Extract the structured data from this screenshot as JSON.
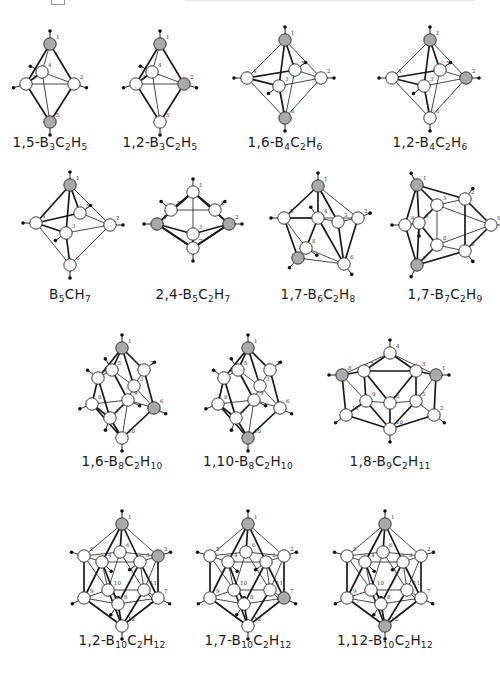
{
  "figure": {
    "colors": {
      "carbon_atom": "#a9a9a9",
      "boron_atom": "#ffffff",
      "bond": "#1a1a1a",
      "hydrogen": "#111111"
    },
    "legend": {
      "gray_circle": "carbon",
      "white_circle": "boron",
      "small_dot": "hydrogen"
    }
  },
  "molecules": [
    {
      "id": "m1",
      "prefix": "1,5-",
      "formula": [
        [
          "B",
          "3"
        ],
        [
          "C",
          "2"
        ],
        [
          "H",
          "5"
        ]
      ],
      "label": "1,5-B3C2H5",
      "carbons": [
        "1",
        "5"
      ],
      "row": 1
    },
    {
      "id": "m2",
      "prefix": "1,2-",
      "formula": [
        [
          "B",
          "3"
        ],
        [
          "C",
          "2"
        ],
        [
          "H",
          "5"
        ]
      ],
      "label": "1,2-B3C2H5",
      "carbons": [
        "1",
        "2"
      ],
      "row": 1
    },
    {
      "id": "m3",
      "prefix": "1,6-",
      "formula": [
        [
          "B",
          "4"
        ],
        [
          "C",
          "2"
        ],
        [
          "H",
          "6"
        ]
      ],
      "label": "1,6-B4C2H6",
      "carbons": [
        "1",
        "6"
      ],
      "row": 1
    },
    {
      "id": "m4",
      "prefix": "1,2-",
      "formula": [
        [
          "B",
          "4"
        ],
        [
          "C",
          "2"
        ],
        [
          "H",
          "6"
        ]
      ],
      "label": "1,2-B4C2H6",
      "carbons": [
        "1",
        "2"
      ],
      "row": 1
    },
    {
      "id": "m5",
      "prefix": "",
      "formula": [
        [
          "B",
          "5"
        ],
        [
          "C",
          ""
        ],
        [
          "H",
          "7"
        ]
      ],
      "label": "B5CH7",
      "carbons": [
        "1"
      ],
      "row": 2
    },
    {
      "id": "m6",
      "prefix": "2,4-",
      "formula": [
        [
          "B",
          "5"
        ],
        [
          "C",
          "2"
        ],
        [
          "H",
          "7"
        ]
      ],
      "label": "2,4-B5C2H7",
      "carbons": [
        "2",
        "4"
      ],
      "row": 2
    },
    {
      "id": "m7",
      "prefix": "1,7-",
      "formula": [
        [
          "B",
          "6"
        ],
        [
          "C",
          "2"
        ],
        [
          "H",
          "8"
        ]
      ],
      "label": "1,7-B6C2H8",
      "carbons": [
        "1",
        "7"
      ],
      "row": 2
    },
    {
      "id": "m8",
      "prefix": "1,7-",
      "formula": [
        [
          "B",
          "7"
        ],
        [
          "C",
          "2"
        ],
        [
          "H",
          "9"
        ]
      ],
      "label": "1,7-B7C2H9",
      "carbons": [
        "1",
        "7"
      ],
      "row": 2
    },
    {
      "id": "m9",
      "prefix": "1,6-",
      "formula": [
        [
          "B",
          "8"
        ],
        [
          "C",
          "2"
        ],
        [
          "H",
          "10"
        ]
      ],
      "label": "1,6-B8C2H10",
      "carbons": [
        "1",
        "6"
      ],
      "row": 3
    },
    {
      "id": "m10",
      "prefix": "1,10-",
      "formula": [
        [
          "B",
          "8"
        ],
        [
          "C",
          "2"
        ],
        [
          "H",
          "10"
        ]
      ],
      "label": "1,10-B8C2H10",
      "carbons": [
        "1",
        "10"
      ],
      "row": 3
    },
    {
      "id": "m11",
      "prefix": "1,8-",
      "formula": [
        [
          "B",
          "9"
        ],
        [
          "C",
          "2"
        ],
        [
          "H",
          "11"
        ]
      ],
      "label": "1,8-B9C2H11",
      "carbons": [
        "1",
        "8"
      ],
      "row": 3
    },
    {
      "id": "m12",
      "prefix": "1,2-",
      "formula": [
        [
          "B",
          "10"
        ],
        [
          "C",
          "2"
        ],
        [
          "H",
          "12"
        ]
      ],
      "label": "1,2-B10C2H12",
      "carbons": [
        "1",
        "2"
      ],
      "row": 4
    },
    {
      "id": "m13",
      "prefix": "1,7-",
      "formula": [
        [
          "B",
          "10"
        ],
        [
          "C",
          "2"
        ],
        [
          "H",
          "12"
        ]
      ],
      "label": "1,7-B10C2H12",
      "carbons": [
        "1",
        "7"
      ],
      "row": 4
    },
    {
      "id": "m14",
      "prefix": "1,12-",
      "formula": [
        [
          "B",
          "10"
        ],
        [
          "C",
          "2"
        ],
        [
          "H",
          "12"
        ]
      ],
      "label": "1,12-B10C2H12",
      "carbons": [
        "1",
        "12"
      ],
      "row": 4
    }
  ]
}
